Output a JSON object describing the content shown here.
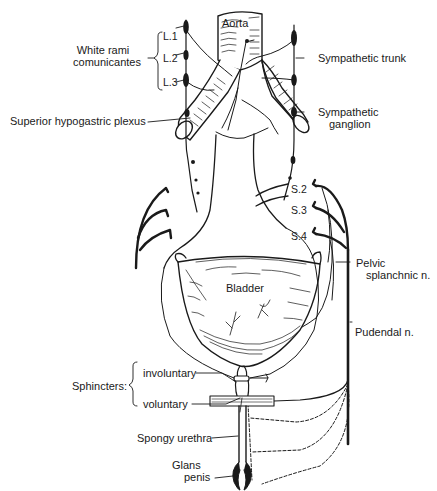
{
  "figure": {
    "labels": {
      "aorta": "Aorta",
      "white_rami_line1": "White rami",
      "white_rami_line2": "comunicantes",
      "l1": "L.1",
      "l2": "L.2",
      "l3": "L.3",
      "sympathetic_trunk": "Sympathetic trunk",
      "superior_hypogastric_plexus": "Superior hypogastric plexus",
      "sympathetic_ganglion_line1": "Sympathetic",
      "sympathetic_ganglion_line2": "ganglion",
      "s2": "S.2",
      "s3": "S.3",
      "s4": "S.4",
      "pelvic_splanchnic_line1": "Pelvic",
      "pelvic_splanchnic_line2": "splanchnic n.",
      "bladder": "Bladder",
      "pudendal": "Pudendal n.",
      "sphincters": "Sphincters:",
      "involuntary": "involuntary",
      "voluntary": "voluntary",
      "spongy_urethra": "Spongy  urethra",
      "glans_line1": "Glans",
      "glans_line2": "penis"
    },
    "colors": {
      "ink": "#1a1a1a",
      "background": "#ffffff"
    }
  }
}
